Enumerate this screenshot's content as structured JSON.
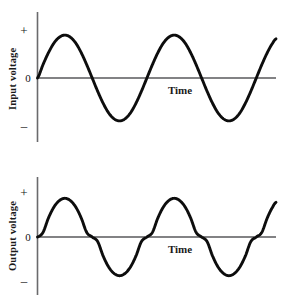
{
  "figure": {
    "background_color": "#ffffff",
    "curve_color": "#0d0d0d",
    "axis_color": "#59595b"
  },
  "chart_data": [
    {
      "type": "line",
      "id": "input-waveform",
      "title": "",
      "xlabel": "Time",
      "ylabel": "Input voltage",
      "ytick_labels": [
        "+",
        "0",
        "–"
      ],
      "xlim": [
        0,
        2.18
      ],
      "ylim": [
        -1.15,
        1.15
      ],
      "grid": false,
      "legend": "none",
      "waveform": "sine",
      "cycles": 2.18,
      "amplitude": 0.78,
      "description": "Undistorted sinusoidal input voltage versus time",
      "series": [
        {
          "name": "Input voltage",
          "x": [
            0.0,
            0.05,
            0.1,
            0.15,
            0.2,
            0.25,
            0.3,
            0.35,
            0.4,
            0.45,
            0.5,
            0.55,
            0.6,
            0.65,
            0.7,
            0.75,
            0.8,
            0.85,
            0.9,
            0.95,
            1.0,
            1.05,
            1.1,
            1.15,
            1.2,
            1.25,
            1.3,
            1.35,
            1.4,
            1.45,
            1.5,
            1.55,
            1.6,
            1.65,
            1.7,
            1.75,
            1.8,
            1.85,
            1.9,
            1.95,
            2.0,
            2.05,
            2.1,
            2.15,
            2.18
          ],
          "y": [
            0.0,
            0.241,
            0.459,
            0.634,
            0.742,
            0.78,
            0.742,
            0.634,
            0.459,
            0.241,
            0.0,
            -0.241,
            -0.459,
            -0.634,
            -0.742,
            -0.78,
            -0.742,
            -0.634,
            -0.459,
            -0.241,
            0.0,
            0.241,
            0.459,
            0.634,
            0.742,
            0.78,
            0.742,
            0.634,
            0.459,
            0.241,
            0.0,
            -0.241,
            -0.459,
            -0.634,
            -0.742,
            -0.78,
            -0.742,
            -0.634,
            -0.459,
            -0.241,
            0.0,
            0.241,
            0.459,
            0.634,
            0.711
          ]
        }
      ]
    },
    {
      "type": "line",
      "id": "output-waveform",
      "title": "",
      "xlabel": "Time",
      "ylabel": "Output voltage",
      "ytick_labels": [
        "+",
        "0",
        "–"
      ],
      "xlim": [
        0,
        2.18
      ],
      "ylim": [
        -1.15,
        1.15
      ],
      "grid": false,
      "legend": "none",
      "waveform": "crossover-distorted-sine",
      "cycles": 2.18,
      "amplitude": 0.78,
      "deadband": 0.17,
      "description": "Output voltage showing crossover distortion: flattened dead-band near the zero crossings with steep transitions",
      "series": [
        {
          "name": "Output voltage",
          "x": [
            0.0,
            0.05,
            0.1,
            0.15,
            0.2,
            0.25,
            0.3,
            0.35,
            0.4,
            0.45,
            0.5,
            0.55,
            0.6,
            0.65,
            0.7,
            0.75,
            0.8,
            0.85,
            0.9,
            0.95,
            1.0,
            1.05,
            1.1,
            1.15,
            1.2,
            1.25,
            1.3,
            1.35,
            1.4,
            1.45,
            1.5,
            1.55,
            1.6,
            1.65,
            1.7,
            1.75,
            1.8,
            1.85,
            1.9,
            1.95,
            2.0,
            2.05,
            2.1,
            2.15,
            2.18
          ],
          "y": [
            0.0,
            0.079,
            0.327,
            0.516,
            0.628,
            0.667,
            0.628,
            0.516,
            0.327,
            0.079,
            0.0,
            -0.079,
            -0.327,
            -0.516,
            -0.628,
            -0.667,
            -0.628,
            -0.516,
            -0.327,
            -0.079,
            0.0,
            0.079,
            0.327,
            0.516,
            0.628,
            0.667,
            0.628,
            0.516,
            0.327,
            0.079,
            0.0,
            -0.079,
            -0.327,
            -0.516,
            -0.628,
            -0.667,
            -0.628,
            -0.516,
            -0.327,
            -0.079,
            0.0,
            0.079,
            0.327,
            0.516,
            0.597
          ]
        }
      ]
    }
  ]
}
